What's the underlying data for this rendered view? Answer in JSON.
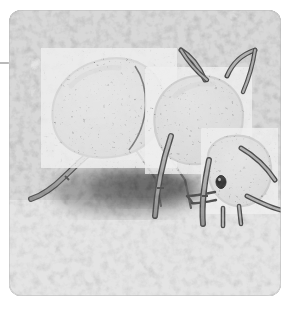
{
  "page": {
    "background_color": "#ffffff",
    "width": 290,
    "height": 310
  },
  "artifact": {
    "name": "left-edge-rule",
    "color": "#b9b9b9"
  },
  "photo": {
    "title": "Ant on sandy ground",
    "alt_text": "Grayscale illustration of an ant standing on mottled sandy ground beside a dark burrow hole",
    "subject": "ant",
    "style": "grayscale illustration",
    "corner_radius": 12,
    "frame": {
      "x": 9,
      "y": 10,
      "width": 272,
      "height": 286
    },
    "palette": {
      "ground_base": "#9f9f9f",
      "ground_light": "#c9c9c9",
      "ground_lighter": "#dedede",
      "ground_dark": "#848484",
      "ground_darker": "#6f6f6f",
      "shadow": "#5e5e5e",
      "burrow_hole": "#4a4a4a",
      "body_fill": "#7b7b7b",
      "body_fill_dark": "#6a6a6a",
      "body_highlight": "#b5b5b5",
      "body_speckle": "#d6d6d6",
      "outline": "#2e2e2e",
      "leg_fill": "#9a9a9a",
      "eye": "#151515"
    },
    "parts": [
      {
        "name": "gaster",
        "label": "Gaster (abdomen)"
      },
      {
        "name": "mesosoma",
        "label": "Mesosoma (thorax)"
      },
      {
        "name": "head",
        "label": "Head"
      },
      {
        "name": "petiole",
        "label": "Petiole"
      },
      {
        "name": "antenna-left",
        "label": "Left antenna"
      },
      {
        "name": "antenna-right",
        "label": "Right antenna"
      },
      {
        "name": "foreleg",
        "label": "Foreleg"
      },
      {
        "name": "midleg",
        "label": "Midleg"
      },
      {
        "name": "hindleg",
        "label": "Hindleg"
      },
      {
        "name": "mandibles",
        "label": "Mandibles"
      },
      {
        "name": "eye",
        "label": "Compound eye"
      },
      {
        "name": "burrow-hole",
        "label": "Burrow hole"
      },
      {
        "name": "cast-shadow",
        "label": "Cast shadow"
      }
    ]
  }
}
